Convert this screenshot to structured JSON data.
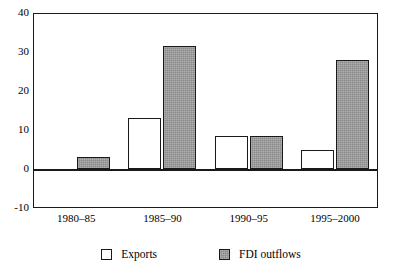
{
  "chart_data": {
    "type": "bar",
    "title": "",
    "subtitle": "",
    "xlabel": "",
    "ylabel": "",
    "categories": [
      "1980–85",
      "1985–90",
      "1990–95",
      "1995–2000"
    ],
    "series": [
      {
        "name": "Exports",
        "color": "#ffffff",
        "values": [
          -0.5,
          13,
          8.5,
          5
        ]
      },
      {
        "name": "FDI outflows",
        "color": "#8a8a8a",
        "values": [
          3,
          31.5,
          8.5,
          28
        ]
      }
    ],
    "ylim": [
      -10,
      40
    ],
    "yticks": [
      40,
      30,
      20,
      10,
      0,
      -10
    ],
    "ytick_labels": [
      "40",
      "30",
      "20",
      "10",
      "0",
      "-10"
    ],
    "grid": false,
    "legend_position": "bottom",
    "zero_line": true,
    "annotations": []
  },
  "legend": {
    "items": [
      {
        "label": "Exports",
        "swatch": "exports-swatch"
      },
      {
        "label": "FDI outflows",
        "swatch": "fdi-outflows-swatch"
      }
    ]
  },
  "colors": {
    "axis": "#1a1a1a",
    "exports_fill": "#ffffff",
    "fdi_fill": "#8a8a8a",
    "background": "#ffffff"
  }
}
